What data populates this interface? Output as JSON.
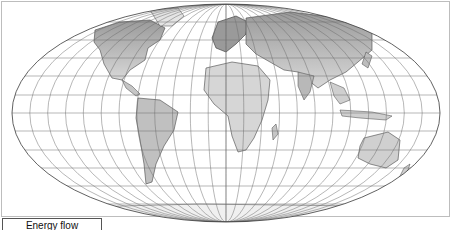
{
  "map": {
    "projection": "mollweide",
    "style": "grayscale",
    "colors": {
      "background": "#ffffff",
      "frame": "#bdbdbd",
      "graticule": "#6e6e6e",
      "outline": "#3a3a3a",
      "land_light": "#e4e4e4",
      "land_mid": "#c6c6c6",
      "land_dark": "#9a9a9a",
      "coast": "#444444"
    }
  },
  "legend": {
    "title": "Energy flow"
  }
}
